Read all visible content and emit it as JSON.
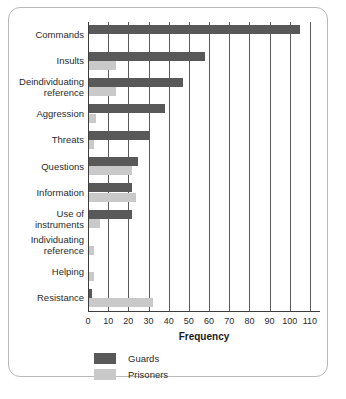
{
  "chart_data": {
    "type": "bar",
    "orientation": "horizontal",
    "title": "",
    "xlabel": "Frequency",
    "ylabel": "",
    "xlim": [
      0,
      115
    ],
    "xticks": [
      0,
      10,
      20,
      30,
      40,
      50,
      60,
      70,
      80,
      90,
      100,
      110
    ],
    "grid": true,
    "legend_position": "bottom-left",
    "categories": [
      "Commands",
      "Insults",
      "Deindividuating reference",
      "Aggression",
      "Threats",
      "Questions",
      "Information",
      "Use of instruments",
      "Individuating reference",
      "Helping",
      "Resistance"
    ],
    "category_lines": [
      [
        "Commands"
      ],
      [
        "Insults"
      ],
      [
        "Deindividuating",
        "reference"
      ],
      [
        "Aggression"
      ],
      [
        "Threats"
      ],
      [
        "Questions"
      ],
      [
        "Information"
      ],
      [
        "Use of",
        "instruments"
      ],
      [
        "Individuating",
        "reference"
      ],
      [
        "Helping"
      ],
      [
        "Resistance"
      ]
    ],
    "series": [
      {
        "name": "Guards",
        "color": "#595959",
        "values": [
          105,
          58,
          47,
          38,
          30,
          25,
          22,
          22,
          0,
          0,
          2
        ]
      },
      {
        "name": "Prisoners",
        "color": "#c9c9c9",
        "values": [
          0,
          14,
          14,
          4,
          3,
          22,
          24,
          6,
          3,
          3,
          32
        ]
      }
    ]
  },
  "legend": {
    "items": [
      {
        "label": "Guards",
        "color": "#595959"
      },
      {
        "label": "Prisoners",
        "color": "#c9c9c9"
      }
    ]
  },
  "axis": {
    "x_title": "Frequency"
  }
}
